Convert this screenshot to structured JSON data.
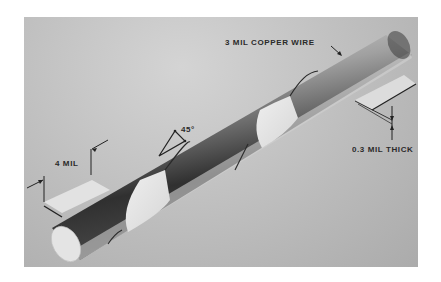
{
  "figure": {
    "labels": {
      "wire": "3 MIL COPPER WIRE",
      "angle": "45°",
      "width": "4 MIL",
      "thickness": "0.3 MIL THICK"
    },
    "colors": {
      "page": "#ffffff",
      "background": "#bdbdbd",
      "ribbon": "#e6e6e6",
      "wire_dark": "#2e2e2e",
      "wire_light": "#e0e0e0",
      "ink": "#2a2a2a"
    }
  }
}
